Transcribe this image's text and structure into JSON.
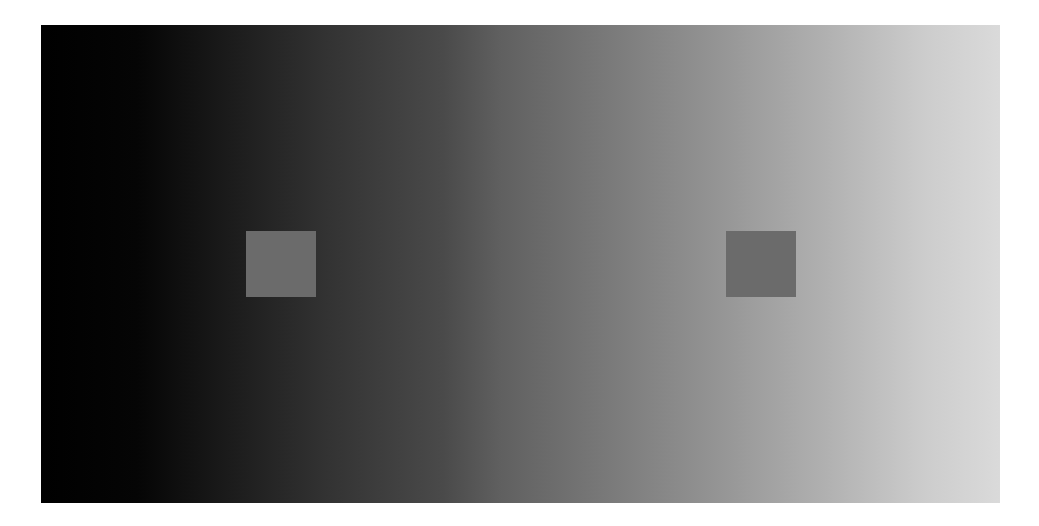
{
  "illustration": {
    "name": "simultaneous-contrast-illusion",
    "gradient": {
      "start_color": "#000000",
      "end_color": "#dadada",
      "direction": "left-to-right"
    },
    "squares": [
      {
        "id": "left",
        "color": "#6b6b6b"
      },
      {
        "id": "right",
        "color": "#6b6b6b"
      }
    ]
  }
}
